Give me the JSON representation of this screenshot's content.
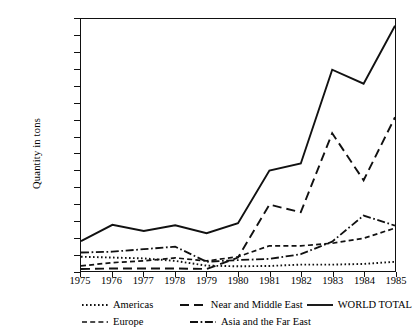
{
  "chart_data": {
    "type": "line",
    "title": "",
    "xlabel": "",
    "ylabel": "Quantity in tons",
    "x": [
      1975,
      1976,
      1977,
      1978,
      1979,
      1980,
      1981,
      1982,
      1983,
      1984,
      1985
    ],
    "categories": [
      "1975",
      "1976",
      "1977",
      "1978",
      "1979",
      "1980",
      "1981",
      "1982",
      "1983",
      "1984",
      "1985"
    ],
    "xlim": [
      1975,
      1985
    ],
    "ylim": [
      0,
      15
    ],
    "yticks": [
      0,
      1,
      2,
      3,
      4,
      5,
      6,
      7,
      8,
      9,
      10,
      11,
      12,
      13,
      14,
      15
    ],
    "grid": false,
    "legend_position": "below",
    "series": [
      {
        "name": "Americas",
        "style": "dotted",
        "values": [
          0.85,
          0.8,
          0.75,
          0.6,
          0.32,
          0.28,
          0.3,
          0.38,
          0.38,
          0.42,
          0.55
        ]
      },
      {
        "name": "Europe",
        "style": "dashed-short",
        "values": [
          0.3,
          0.5,
          0.6,
          0.78,
          0.6,
          0.85,
          1.5,
          1.5,
          1.65,
          1.95,
          2.55
        ]
      },
      {
        "name": "Near and Middle East",
        "style": "dashed-long",
        "values": [
          0.12,
          0.15,
          0.15,
          0.15,
          0.12,
          0.8,
          3.95,
          3.5,
          8.2,
          5.4,
          9.15
        ]
      },
      {
        "name": "Asia and the Far East",
        "style": "dash-dot",
        "values": [
          1.1,
          1.15,
          1.3,
          1.45,
          0.55,
          0.65,
          0.72,
          1.0,
          1.75,
          3.3,
          2.7
        ]
      },
      {
        "name": "WORLD TOTAL",
        "style": "solid",
        "values": [
          1.78,
          2.75,
          2.38,
          2.72,
          2.25,
          2.85,
          5.98,
          6.4,
          11.98,
          11.15,
          14.6
        ]
      }
    ]
  },
  "axis": {
    "ylabel": "Quantity in tons"
  },
  "legend": {
    "rows": [
      [
        {
          "name": "Americas",
          "style": "dotted"
        },
        {
          "name": "Near and Middle East",
          "style": "dashed-long"
        },
        {
          "name": "WORLD TOTAL",
          "style": "solid"
        }
      ],
      [
        {
          "name": "Europe",
          "style": "dashed-short"
        },
        {
          "name": "Asia and the Far East",
          "style": "dash-dot"
        }
      ]
    ]
  },
  "colors": {
    "line": "#111111",
    "background": "#ffffff",
    "axis": "#111111"
  }
}
